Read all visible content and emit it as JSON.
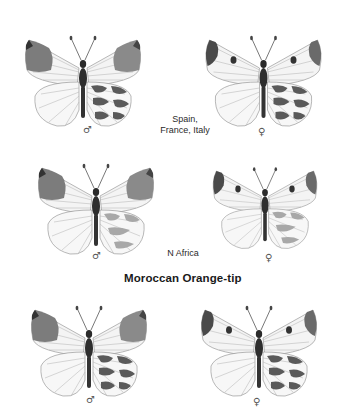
{
  "plate": {
    "title": "Moroccan Orange-tip",
    "groups": [
      {
        "region": "Spain, France, Italy",
        "specimens": [
          {
            "sex_symbol": "♂",
            "sex": "male",
            "icon": "butterfly-male-orange-tip"
          },
          {
            "sex_symbol": "♀",
            "sex": "female",
            "icon": "butterfly-female"
          }
        ]
      },
      {
        "region": "N Africa",
        "specimens": [
          {
            "sex_symbol": "♂",
            "sex": "male",
            "icon": "butterfly-male-orange-tip"
          },
          {
            "sex_symbol": "♀",
            "sex": "female",
            "icon": "butterfly-female"
          }
        ]
      },
      {
        "region": "",
        "specimens": [
          {
            "sex_symbol": "♂",
            "sex": "male",
            "view": "underside-hindwing-marbled",
            "icon": "butterfly-male-orange-tip"
          },
          {
            "sex_symbol": "♀",
            "sex": "female",
            "view": "underside-hindwing-marbled",
            "icon": "butterfly-female"
          }
        ]
      }
    ]
  },
  "colors": {
    "background": "#ffffff",
    "wing_tip_gray": "#7a7a7a",
    "wing_base": "#f2f2f2",
    "vein": "#9a9a9a",
    "body": "#2b2b2b"
  }
}
